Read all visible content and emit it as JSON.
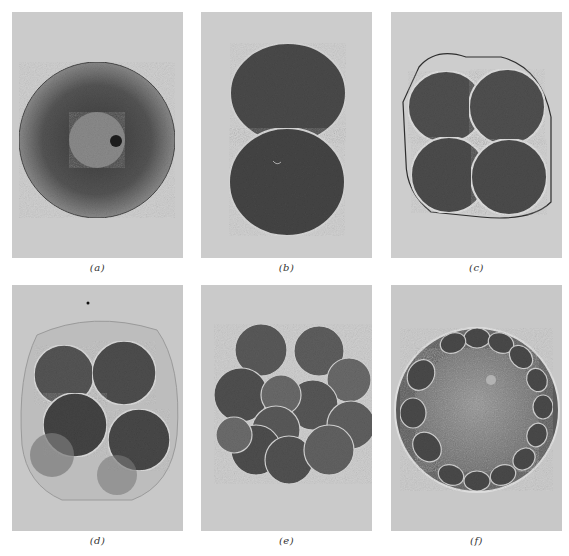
{
  "figure": {
    "background_color": "#c9c9c9",
    "panels": [
      {
        "id": "a",
        "label": "(a)",
        "stage": "fertilized egg (single cell with nucleus)"
      },
      {
        "id": "b",
        "label": "(b)",
        "stage": "2-cell stage"
      },
      {
        "id": "c",
        "label": "(c)",
        "stage": "4-cell stage"
      },
      {
        "id": "d",
        "label": "(d)",
        "stage": "8-cell stage"
      },
      {
        "id": "e",
        "label": "(e)",
        "stage": "16-cell / morula stage"
      },
      {
        "id": "f",
        "label": "(f)",
        "stage": "blastula (hollow ball of cells)"
      }
    ]
  }
}
